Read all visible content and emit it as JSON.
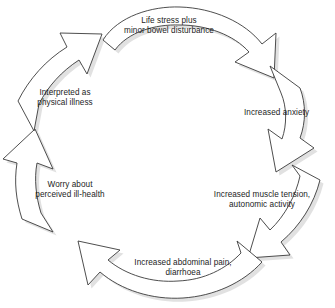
{
  "diagram": {
    "type": "cyclical-process",
    "direction": "clockwise",
    "background_color": "#ffffff",
    "arrow_fill_color": "#ffffff",
    "arrow_stroke_color": "#3a3a3a",
    "shadow_color": "#c9c9c9",
    "text_color": "#1d1d1d",
    "nodes": [
      {
        "id": "life-stress",
        "position": "top",
        "lines": [
          "Life stress plus",
          "minor bowel disturbance"
        ]
      },
      {
        "id": "increased-anxiety",
        "position": "right-upper",
        "lines": [
          "Increased anxiety"
        ]
      },
      {
        "id": "muscle-tension",
        "position": "right-lower",
        "lines": [
          "Increased muscle tension,",
          "autonomic activity"
        ]
      },
      {
        "id": "abdominal-pain",
        "position": "bottom",
        "lines": [
          "Increased abdominal pain,",
          "diarrhoea"
        ]
      },
      {
        "id": "worry-ill-health",
        "position": "left-lower",
        "lines": [
          "Worry about",
          "perceived ill-health"
        ]
      },
      {
        "id": "interpreted-illness",
        "position": "left-upper",
        "lines": [
          "Interpreted as",
          "physical illness"
        ]
      }
    ]
  }
}
